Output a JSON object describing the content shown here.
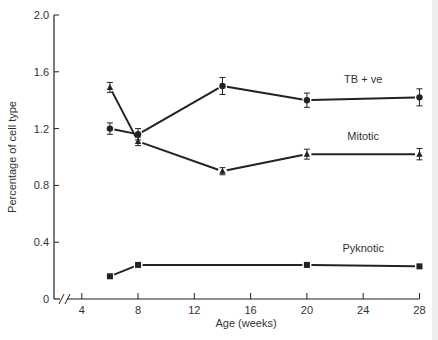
{
  "chart_data": {
    "type": "line",
    "title": "",
    "xlabel": "Age (weeks)",
    "ylabel": "Percentage of cell type",
    "xlim": [
      2,
      28
    ],
    "ylim": [
      0,
      2.0
    ],
    "x_ticks": [
      4,
      8,
      12,
      16,
      20,
      24,
      28
    ],
    "x_tick_labels": [
      "4",
      "8",
      "12",
      "16",
      "20",
      "24",
      "28"
    ],
    "y_ticks": [
      0,
      0.4,
      0.8,
      1.2,
      1.6,
      2.0
    ],
    "y_tick_labels": [
      "0",
      "0.4",
      "0.8",
      "1.2",
      "1.6",
      "2.0"
    ],
    "x_axis_break": true,
    "grid": false,
    "legend": "inline labels",
    "series": [
      {
        "name": "TB + ve",
        "marker": "circle",
        "x": [
          6,
          8,
          14,
          20,
          28
        ],
        "values": [
          1.2,
          1.16,
          1.5,
          1.4,
          1.42
        ],
        "error": [
          0.04,
          0.04,
          0.06,
          0.05,
          0.06
        ],
        "label_pos": {
          "x": 24,
          "y": 1.52
        },
        "segments": [
          [
            0,
            1
          ],
          [
            1,
            2
          ],
          [
            2,
            3
          ],
          [
            3,
            4
          ]
        ]
      },
      {
        "name": "Mitotic",
        "marker": "triangle",
        "x": [
          6,
          8,
          14,
          20,
          28
        ],
        "values": [
          1.49,
          1.11,
          0.9,
          1.02,
          1.02
        ],
        "error": [
          0.035,
          0.03,
          0.025,
          0.035,
          0.04
        ],
        "label_pos": {
          "x": 24,
          "y": 1.12
        },
        "segments": [
          [
            0,
            1
          ],
          [
            1,
            2
          ],
          [
            2,
            3
          ],
          [
            3,
            4
          ]
        ]
      },
      {
        "name": "Pyknotic",
        "marker": "square",
        "x": [
          6,
          8,
          20,
          28
        ],
        "values": [
          0.16,
          0.24,
          0.24,
          0.23
        ],
        "error": [
          0,
          0,
          0,
          0
        ],
        "label_pos": {
          "x": 24,
          "y": 0.33
        },
        "segments": [
          [
            0,
            1
          ],
          [
            1,
            2
          ],
          [
            2,
            3
          ]
        ]
      }
    ]
  }
}
